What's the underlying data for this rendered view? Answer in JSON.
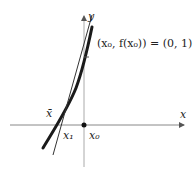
{
  "diagram": {
    "axes": {
      "x_label": "x",
      "y_label": "y"
    },
    "point_label": "(x₀, f(x₀)) = (0, 1)",
    "labels": {
      "x_bar": "x̄",
      "x1": "x₁",
      "x0": "x₀"
    },
    "colors": {
      "axis": "#888888",
      "curve": "#1a1a1a",
      "tangent": "#333333",
      "text": "#222222"
    }
  }
}
